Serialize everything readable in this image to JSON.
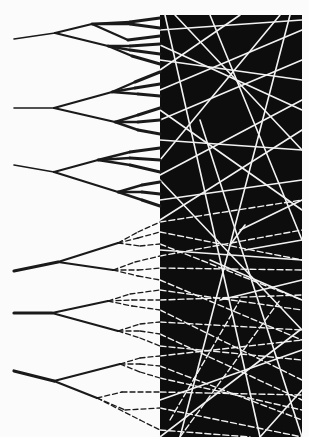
{
  "figure": {
    "width": 309,
    "height": 437,
    "background": "#fbfbfb",
    "ink": "#1a1a1a",
    "light_ink": "#f2f2f2",
    "panel": {
      "x": 160,
      "y": 15,
      "width": 142,
      "height": 422,
      "color": "#0d0d0d"
    }
  },
  "trees": [
    {
      "style": "solid",
      "root": [
        14,
        39
      ],
      "node": [
        55,
        33
      ],
      "branches": [
        [
          92,
          24
        ],
        [
          108,
          46
        ]
      ],
      "leaves": [
        [
          [
            130,
            22
          ],
          [
            160,
            18
          ]
        ],
        [
          [
            130,
            24
          ],
          [
            160,
            28
          ]
        ],
        [
          [
            128,
            40
          ],
          [
            160,
            36
          ]
        ],
        [
          [
            130,
            46
          ],
          [
            160,
            44
          ]
        ],
        [
          [
            130,
            50
          ],
          [
            160,
            54
          ]
        ],
        [
          [
            132,
            56
          ],
          [
            160,
            64
          ]
        ]
      ]
    },
    {
      "style": "solid",
      "root": [
        14,
        108
      ],
      "node": [
        54,
        108
      ],
      "branches": [
        [
          112,
          92
        ],
        [
          115,
          122
        ]
      ],
      "leaves": [
        [
          [
            135,
            82
          ],
          [
            160,
            72
          ]
        ],
        [
          [
            135,
            88
          ],
          [
            160,
            84
          ]
        ],
        [
          [
            138,
            94
          ],
          [
            160,
            96
          ]
        ],
        [
          [
            138,
            115
          ],
          [
            160,
            108
          ]
        ],
        [
          [
            138,
            122
          ],
          [
            160,
            120
          ]
        ],
        [
          [
            138,
            130
          ],
          [
            160,
            134
          ]
        ]
      ]
    },
    {
      "style": "solid",
      "root": [
        14,
        165
      ],
      "node": [
        54,
        172
      ],
      "branches": [
        [
          98,
          160
        ],
        [
          118,
          192
        ]
      ],
      "leaves": [
        [
          [
            130,
            152
          ],
          [
            160,
            148
          ]
        ],
        [
          [
            130,
            158
          ],
          [
            160,
            160
          ]
        ],
        [
          [
            130,
            165
          ],
          [
            160,
            172
          ]
        ],
        [
          [
            142,
            185
          ],
          [
            160,
            182
          ]
        ],
        [
          [
            142,
            192
          ],
          [
            160,
            194
          ]
        ],
        [
          [
            142,
            200
          ],
          [
            160,
            206
          ]
        ]
      ]
    },
    {
      "style": "mixed",
      "root": [
        14,
        271
      ],
      "node": [
        58,
        262
      ],
      "branches": [
        [
          118,
          243
        ],
        [
          113,
          270
        ]
      ],
      "leaves": [
        [
          [
            138,
            232
          ],
          [
            160,
            222
          ]
        ],
        [
          [
            138,
            238
          ],
          [
            160,
            232
          ]
        ],
        [
          [
            140,
            246
          ],
          [
            160,
            244
          ]
        ],
        [
          [
            135,
            262
          ],
          [
            160,
            256
          ]
        ],
        [
          [
            138,
            270
          ],
          [
            160,
            268
          ]
        ],
        [
          [
            138,
            276
          ],
          [
            160,
            280
          ]
        ]
      ]
    },
    {
      "style": "mixed",
      "root": [
        14,
        313
      ],
      "node": [
        52,
        313
      ],
      "branches": [
        [
          108,
          301
        ],
        [
          118,
          331
        ]
      ],
      "leaves": [
        [
          [
            130,
            294
          ],
          [
            160,
            290
          ]
        ],
        [
          [
            132,
            300
          ],
          [
            160,
            300
          ]
        ],
        [
          [
            132,
            306
          ],
          [
            160,
            310
          ]
        ],
        [
          [
            140,
            324
          ],
          [
            160,
            322
          ]
        ],
        [
          [
            140,
            331
          ],
          [
            160,
            334
          ]
        ],
        [
          [
            140,
            338
          ],
          [
            160,
            346
          ]
        ]
      ]
    },
    {
      "style": "mixed",
      "root": [
        14,
        371
      ],
      "node": [
        54,
        381
      ],
      "branches": [
        [
          120,
          364
        ],
        [
          97,
          398
        ]
      ],
      "leaves": [
        [
          [
            140,
            358
          ],
          [
            160,
            356
          ]
        ],
        [
          [
            140,
            364
          ],
          [
            160,
            366
          ]
        ],
        [
          [
            140,
            372
          ],
          [
            160,
            378
          ]
        ],
        [
          [
            122,
            392
          ],
          [
            160,
            392
          ]
        ],
        [
          [
            125,
            410
          ],
          [
            160,
            408
          ]
        ],
        [
          [
            140,
            420
          ],
          [
            160,
            430
          ]
        ]
      ]
    }
  ],
  "panel_lines": {
    "solid": [
      [
        [
          160,
          30
        ],
        [
          302,
          20
        ]
      ],
      [
        [
          160,
          45
        ],
        [
          302,
          110
        ]
      ],
      [
        [
          175,
          15
        ],
        [
          302,
          150
        ]
      ],
      [
        [
          160,
          70
        ],
        [
          240,
          15
        ]
      ],
      [
        [
          160,
          90
        ],
        [
          302,
          30
        ]
      ],
      [
        [
          160,
          60
        ],
        [
          302,
          80
        ]
      ],
      [
        [
          160,
          120
        ],
        [
          302,
          60
        ]
      ],
      [
        [
          210,
          15
        ],
        [
          302,
          240
        ]
      ],
      [
        [
          160,
          140
        ],
        [
          302,
          150
        ]
      ],
      [
        [
          160,
          160
        ],
        [
          280,
          15
        ]
      ],
      [
        [
          160,
          175
        ],
        [
          302,
          100
        ]
      ],
      [
        [
          160,
          200
        ],
        [
          302,
          180
        ]
      ],
      [
        [
          160,
          110
        ],
        [
          302,
          210
        ]
      ],
      [
        [
          180,
          437
        ],
        [
          290,
          15
        ]
      ],
      [
        [
          160,
          220
        ],
        [
          302,
          130
        ]
      ],
      [
        [
          160,
          250
        ],
        [
          302,
          260
        ]
      ],
      [
        [
          200,
          120
        ],
        [
          302,
          437
        ]
      ],
      [
        [
          165,
          15
        ],
        [
          260,
          437
        ]
      ],
      [
        [
          160,
          180
        ],
        [
          302,
          330
        ]
      ],
      [
        [
          240,
          230
        ],
        [
          302,
          200
        ]
      ],
      [
        [
          245,
          250
        ],
        [
          302,
          240
        ]
      ],
      [
        [
          220,
          300
        ],
        [
          302,
          280
        ]
      ],
      [
        [
          300,
          330
        ],
        [
          160,
          437
        ]
      ],
      [
        [
          260,
          437
        ],
        [
          302,
          390
        ]
      ],
      [
        [
          230,
          245
        ],
        [
          245,
          225
        ]
      ],
      [
        [
          210,
          260
        ],
        [
          302,
          300
        ]
      ],
      [
        [
          160,
          400
        ],
        [
          302,
          350
        ]
      ]
    ],
    "dashed": [
      [
        [
          160,
          222
        ],
        [
          302,
          200
        ]
      ],
      [
        [
          160,
          232
        ],
        [
          302,
          260
        ]
      ],
      [
        [
          160,
          244
        ],
        [
          302,
          300
        ]
      ],
      [
        [
          160,
          256
        ],
        [
          302,
          230
        ]
      ],
      [
        [
          160,
          268
        ],
        [
          302,
          270
        ]
      ],
      [
        [
          160,
          280
        ],
        [
          302,
          340
        ]
      ],
      [
        [
          160,
          290
        ],
        [
          302,
          310
        ]
      ],
      [
        [
          160,
          300
        ],
        [
          302,
          295
        ]
      ],
      [
        [
          160,
          310
        ],
        [
          302,
          380
        ]
      ],
      [
        [
          160,
          322
        ],
        [
          302,
          330
        ]
      ],
      [
        [
          160,
          334
        ],
        [
          302,
          400
        ]
      ],
      [
        [
          160,
          346
        ],
        [
          302,
          360
        ]
      ],
      [
        [
          160,
          356
        ],
        [
          302,
          340
        ]
      ],
      [
        [
          160,
          366
        ],
        [
          302,
          420
        ]
      ],
      [
        [
          160,
          378
        ],
        [
          302,
          410
        ]
      ],
      [
        [
          160,
          392
        ],
        [
          302,
          395
        ]
      ],
      [
        [
          160,
          408
        ],
        [
          302,
          437
        ]
      ],
      [
        [
          160,
          430
        ],
        [
          250,
          437
        ]
      ],
      [
        [
          170,
          420
        ],
        [
          240,
          300
        ]
      ],
      [
        [
          180,
          437
        ],
        [
          280,
          300
        ]
      ]
    ]
  }
}
